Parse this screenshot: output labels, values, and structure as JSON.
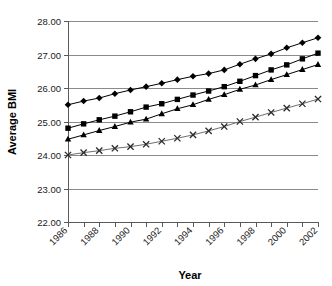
{
  "chart_data": {
    "type": "line",
    "title": "",
    "xlabel": "Year",
    "ylabel": "Average BMI",
    "xlim": [
      1986,
      2002
    ],
    "ylim": [
      22.0,
      28.0
    ],
    "grid": true,
    "legend": "none",
    "y_ticks": [
      "28.00",
      "27.00",
      "26.00",
      "25.00",
      "24.00",
      "23.00",
      "22.00"
    ],
    "y_tick_values": [
      28.0,
      27.0,
      26.0,
      25.0,
      24.0,
      23.0,
      22.0
    ],
    "x_ticks": [
      "1986",
      "1988",
      "1990",
      "1992",
      "1994",
      "1996",
      "1998",
      "2000",
      "2002"
    ],
    "x": [
      1986,
      1987,
      1988,
      1989,
      1990,
      1991,
      1992,
      1993,
      1994,
      1995,
      1996,
      1997,
      1998,
      1999,
      2000,
      2001,
      2002
    ],
    "series": [
      {
        "name": "series-diamond",
        "marker": "diamond",
        "color": "#000000",
        "values": [
          25.5,
          25.61,
          25.7,
          25.83,
          25.94,
          26.04,
          26.14,
          26.25,
          26.35,
          26.43,
          26.54,
          26.71,
          26.87,
          27.02,
          27.2,
          27.35,
          27.5
        ]
      },
      {
        "name": "series-square",
        "marker": "square",
        "color": "#000000",
        "values": [
          24.8,
          24.93,
          25.05,
          25.16,
          25.29,
          25.43,
          25.53,
          25.66,
          25.79,
          25.91,
          26.04,
          26.2,
          26.37,
          26.54,
          26.69,
          26.87,
          27.04
        ]
      },
      {
        "name": "series-triangle",
        "marker": "triangle",
        "color": "#000000",
        "values": [
          24.47,
          24.6,
          24.73,
          24.85,
          24.98,
          25.07,
          25.23,
          25.38,
          25.5,
          25.66,
          25.8,
          25.96,
          26.09,
          26.25,
          26.4,
          26.55,
          26.7
        ]
      },
      {
        "name": "series-cross",
        "marker": "x",
        "color": "#2b2b2b",
        "values": [
          24.0,
          24.07,
          24.13,
          24.2,
          24.25,
          24.32,
          24.41,
          24.5,
          24.6,
          24.72,
          24.85,
          25.0,
          25.13,
          25.27,
          25.4,
          25.53,
          25.67
        ]
      }
    ]
  },
  "axes": {
    "y_title": "Average BMI",
    "x_title": "Year"
  }
}
